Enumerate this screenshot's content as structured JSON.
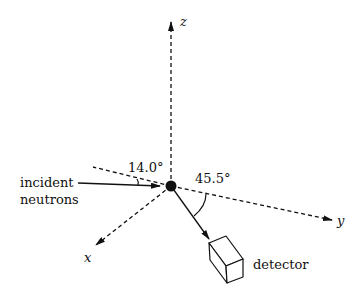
{
  "diagram": {
    "axes": {
      "x": {
        "label": "x"
      },
      "y": {
        "label": "y"
      },
      "z": {
        "label": "z"
      }
    },
    "incident_beam": {
      "label_line1": "incident",
      "label_line2": "neutrons"
    },
    "angles": {
      "incident_angle": "14.0°",
      "detector_angle": "45.5°"
    },
    "detector": {
      "label": "detector"
    },
    "colors": {
      "ink": "#111111",
      "background": "#ffffff"
    }
  }
}
